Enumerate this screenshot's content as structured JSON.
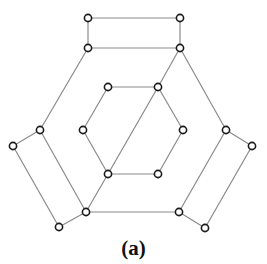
{
  "caption": "(a)",
  "colors": {
    "edge": "#8a8a8a",
    "node_stroke": "#1a1a1a",
    "node_fill": "#ffffff",
    "background": "#ffffff"
  },
  "nodes": [
    {
      "id": "t1",
      "x": 88,
      "y": 18
    },
    {
      "id": "t2",
      "x": 180,
      "y": 18
    },
    {
      "id": "t3",
      "x": 88,
      "y": 48
    },
    {
      "id": "t4",
      "x": 180,
      "y": 48
    },
    {
      "id": "h1",
      "x": 108,
      "y": 87
    },
    {
      "id": "h2",
      "x": 158,
      "y": 87
    },
    {
      "id": "h3",
      "x": 183,
      "y": 130
    },
    {
      "id": "h4",
      "x": 158,
      "y": 174
    },
    {
      "id": "h5",
      "x": 108,
      "y": 174
    },
    {
      "id": "h6",
      "x": 83,
      "y": 130
    },
    {
      "id": "l1",
      "x": 40,
      "y": 130
    },
    {
      "id": "l2",
      "x": 13,
      "y": 146
    },
    {
      "id": "l3",
      "x": 59,
      "y": 227
    },
    {
      "id": "l4",
      "x": 86,
      "y": 212
    },
    {
      "id": "r1",
      "x": 226,
      "y": 130
    },
    {
      "id": "r2",
      "x": 252,
      "y": 146
    },
    {
      "id": "r3",
      "x": 205,
      "y": 228
    },
    {
      "id": "r4",
      "x": 179,
      "y": 212
    }
  ],
  "edges": [
    [
      "t1",
      "t2"
    ],
    [
      "t1",
      "t3"
    ],
    [
      "t2",
      "t4"
    ],
    [
      "t3",
      "t4"
    ],
    [
      "t3",
      "l1"
    ],
    [
      "t4",
      "r1"
    ],
    [
      "t4",
      "h2"
    ],
    [
      "h1",
      "h2"
    ],
    [
      "h2",
      "h3"
    ],
    [
      "h3",
      "h4"
    ],
    [
      "h4",
      "h5"
    ],
    [
      "h5",
      "h6"
    ],
    [
      "h6",
      "h1"
    ],
    [
      "h2",
      "h5"
    ],
    [
      "h5",
      "l4"
    ],
    [
      "l1",
      "l2"
    ],
    [
      "l2",
      "l3"
    ],
    [
      "l3",
      "l4"
    ],
    [
      "l4",
      "l1"
    ],
    [
      "r1",
      "r2"
    ],
    [
      "r2",
      "r3"
    ],
    [
      "r3",
      "r4"
    ],
    [
      "r4",
      "r1"
    ],
    [
      "l4",
      "r4"
    ]
  ]
}
